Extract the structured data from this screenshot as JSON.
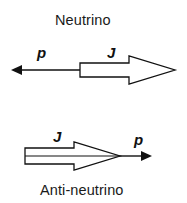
{
  "diagram": {
    "neutrino": {
      "title": "Neutrino",
      "momentum_label": "p",
      "spin_label": "J",
      "momentum_direction": "left",
      "spin_direction": "right"
    },
    "antineutrino": {
      "title": "Anti-neutrino",
      "momentum_label": "p",
      "spin_label": "J",
      "momentum_direction": "right",
      "spin_direction": "right"
    },
    "colors": {
      "stroke": "#111111",
      "fill": "#ffffff",
      "text": "#1a1a1a"
    }
  }
}
